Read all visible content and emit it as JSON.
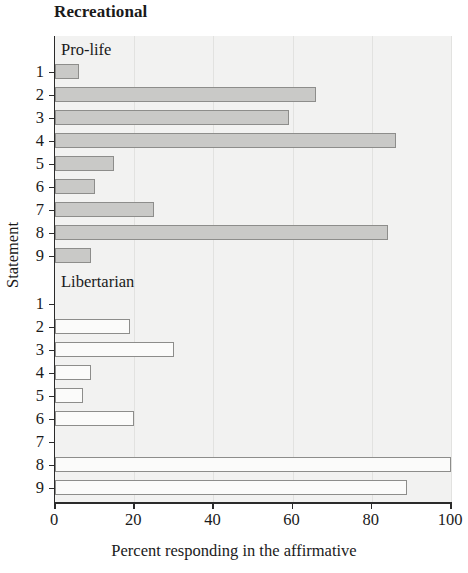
{
  "figure": {
    "title": "Recreational",
    "xlabel": "Percent responding in the affirmative",
    "ylabel": "Statement",
    "group_labels": {
      "prolife": "Pro-life",
      "libertarian": "Libertarian"
    },
    "xticks": [
      "0",
      "20",
      "40",
      "60",
      "80",
      "100"
    ],
    "ycategories": [
      "1",
      "2",
      "3",
      "4",
      "5",
      "6",
      "7",
      "8",
      "9"
    ],
    "colors": {
      "prolife_fill": "#c9c9c7",
      "libertarian_fill": "#fbfbfa",
      "bar_border": "#8d8d8b",
      "axis": "#2b2b2b",
      "plot_background": "#f2f2f1",
      "gridline": "#e2e2e0"
    }
  },
  "chart_data": {
    "type": "bar",
    "orientation": "horizontal",
    "title": "Recreational",
    "xlabel": "Percent responding in the affirmative",
    "ylabel": "Statement",
    "xlim": [
      0,
      100
    ],
    "xticks": [
      0,
      20,
      40,
      60,
      80,
      100
    ],
    "grid": true,
    "categories": [
      "1",
      "2",
      "3",
      "4",
      "5",
      "6",
      "7",
      "8",
      "9"
    ],
    "series": [
      {
        "name": "Pro-life",
        "values": [
          6,
          66,
          59,
          86,
          15,
          10,
          25,
          84,
          9
        ]
      },
      {
        "name": "Libertarian",
        "values": [
          0,
          19,
          30,
          9,
          7,
          20,
          0,
          100,
          89
        ]
      }
    ],
    "legend_position": "inside-top-left-of-each-panel"
  }
}
